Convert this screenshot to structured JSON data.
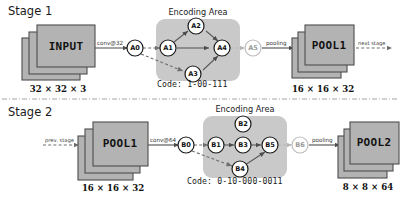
{
  "figure": {
    "separator": "dash-dot-horizontal-rule"
  },
  "stages": [
    {
      "label": "Stage 1",
      "input_block": {
        "name": "INPUT",
        "dims": "32 × 32 × 3"
      },
      "conv_label": "conv@32",
      "encoding_area": {
        "title": "Encoding Area",
        "code_label": "Code:",
        "code_value": "1-00-111",
        "code_full": "Code: 1-00-111",
        "nodes": [
          "A0",
          "A1",
          "A2",
          "A3",
          "A4",
          "A5"
        ],
        "active_nodes": [
          "A0",
          "A1",
          "A2",
          "A3",
          "A4"
        ],
        "faded_nodes": [
          "A5"
        ],
        "edges": [
          {
            "from": "A0",
            "to": "A1",
            "style": "dashed"
          },
          {
            "from": "A0",
            "to": "A3",
            "style": "dashed"
          },
          {
            "from": "A1",
            "to": "A2",
            "style": "solid"
          },
          {
            "from": "A1",
            "to": "A4",
            "style": "solid"
          },
          {
            "from": "A2",
            "to": "A4",
            "style": "solid"
          },
          {
            "from": "A3",
            "to": "A4",
            "style": "solid"
          },
          {
            "from": "A4",
            "to": "A5",
            "style": "dashed"
          }
        ]
      },
      "pooling_label": "pooling",
      "output_block": {
        "name": "POOL1",
        "dims": "16 × 16 × 32"
      },
      "out_arrow_label": "next stage"
    },
    {
      "label": "Stage 2",
      "in_arrow_label": "prev. stage",
      "input_block": {
        "name": "POOL1",
        "dims": "16 × 16 × 32"
      },
      "conv_label": "conv@64",
      "encoding_area": {
        "title": "Encoding Area",
        "code_label": "Code:",
        "code_value": "0-10-000-0011",
        "code_full": "Code: 0-10-000-0011",
        "nodes": [
          "B0",
          "B1",
          "B2",
          "B3",
          "B4",
          "B5",
          "B6"
        ],
        "active_nodes": [
          "B0",
          "B1",
          "B2",
          "B3",
          "B4",
          "B5"
        ],
        "faded_nodes": [
          "B6"
        ],
        "edges": [
          {
            "from": "B0",
            "to": "B1",
            "style": "dashed"
          },
          {
            "from": "B0",
            "to": "B4",
            "style": "dashed"
          },
          {
            "from": "B1",
            "to": "B3",
            "style": "solid"
          },
          {
            "from": "B3",
            "to": "B5",
            "style": "solid"
          },
          {
            "from": "B4",
            "to": "B5",
            "style": "solid"
          },
          {
            "from": "B5",
            "to": "B6",
            "style": "dashed"
          }
        ]
      },
      "pooling_label": "pooling",
      "output_block": {
        "name": "POOL2",
        "dims": "8 × 8 × 64"
      }
    }
  ],
  "colors": {
    "block_fill": "#b3b3b3",
    "block_stroke": "#4d4d4d",
    "enc_area_fill": "#c9c9c9",
    "node_fill": "#ffffff",
    "node_stroke": "#1a1a1a",
    "faded_stroke": "#bdbdbd",
    "edge": "#5a5a5a",
    "text": "#1a1a1a",
    "background": "#ffffff"
  }
}
